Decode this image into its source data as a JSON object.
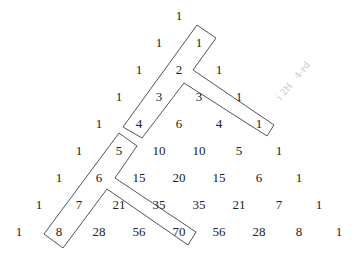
{
  "diagram": {
    "type": "pascal-triangle",
    "rows": [
      [
        1
      ],
      [
        1,
        1
      ],
      [
        1,
        2,
        1
      ],
      [
        1,
        3,
        3,
        1
      ],
      [
        1,
        4,
        6,
        4,
        1
      ],
      [
        1,
        5,
        10,
        10,
        5,
        1
      ],
      [
        1,
        6,
        15,
        20,
        15,
        6,
        1
      ],
      [
        1,
        7,
        21,
        35,
        35,
        21,
        7,
        1
      ],
      [
        1,
        8,
        28,
        56,
        70,
        56,
        28,
        8,
        1
      ]
    ],
    "highlighted_shapes": [
      {
        "name": "upper-hockey-stick",
        "stick_cells": [
          "1 (row1)",
          "2",
          "3",
          "4"
        ],
        "blade_cells": [
          "3 (row3)",
          "1 (row4)"
        ],
        "outline_color": "#444444"
      },
      {
        "name": "lower-hockey-stick",
        "stick_cells": [
          "5",
          "6",
          "7",
          "8"
        ],
        "blade_cells": [
          "21",
          "35",
          "70"
        ],
        "outline_color": "#444444"
      }
    ],
    "margin_note": "faint illegible handwriting"
  }
}
